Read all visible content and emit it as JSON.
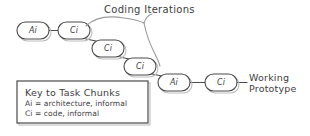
{
  "diagram": {
    "background_color": "#ffffff",
    "stroke_color": "#4a4a4a",
    "accent_color": "#9a9a9a",
    "annotation": {
      "coding_iterations_label": "Coding Iterations"
    },
    "outcome": {
      "line1": "Working",
      "line2": "Prototype"
    },
    "nodes": [
      {
        "label": "Ai",
        "x": 17,
        "y": 22,
        "w": 32,
        "h": 17
      },
      {
        "label": "Ci",
        "x": 58,
        "y": 22,
        "w": 32,
        "h": 17
      },
      {
        "label": "Ci",
        "x": 92,
        "y": 40,
        "w": 32,
        "h": 17
      },
      {
        "label": "Ci",
        "x": 124,
        "y": 58,
        "w": 32,
        "h": 17
      },
      {
        "label": "Ai",
        "x": 158,
        "y": 74,
        "w": 32,
        "h": 17
      },
      {
        "label": "Ci",
        "x": 205,
        "y": 74,
        "w": 32,
        "h": 17
      }
    ],
    "legend": {
      "title": "Key to Task Chunks",
      "entries": [
        "Ai = architecture, informal",
        "Ci = code, informal"
      ]
    }
  }
}
